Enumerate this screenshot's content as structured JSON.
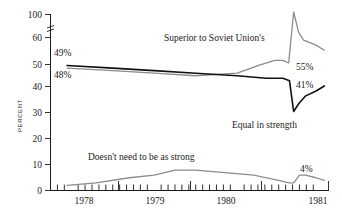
{
  "chart_data": {
    "type": "line",
    "title": "",
    "xlabel": "",
    "ylabel": "PERCENT",
    "ylim": [
      0,
      100
    ],
    "xlim": [
      1977.75,
      1981.1
    ],
    "grid": false,
    "legend_position": "inline-annotations",
    "axis_break": {
      "between": [
        60,
        100
      ],
      "style": "double-slash"
    },
    "ytick_labels": [
      "0",
      "10",
      "20",
      "30",
      "40",
      "50",
      "60",
      "100"
    ],
    "ytick_values": [
      0,
      10,
      20,
      30,
      40,
      50,
      60,
      100
    ],
    "xtick_labels": [
      "1978",
      "1979",
      "1980",
      "1981"
    ],
    "xtick_values": [
      1978,
      1979,
      1980,
      1981
    ],
    "minor_xticks_per_year": 12,
    "series": [
      {
        "name": "Superior to Soviet Union's",
        "color": "#8c8c8c",
        "start_label": "48%",
        "end_label": "55%",
        "x": [
          1977.95,
          1978.5,
          1979.0,
          1979.5,
          1980.0,
          1980.25,
          1980.45,
          1980.55,
          1980.62,
          1980.68,
          1980.74,
          1980.8,
          1980.95,
          1981.05
        ],
        "values": [
          48,
          47,
          46,
          45,
          46,
          49,
          51,
          51,
          50,
          70,
          62,
          59,
          57,
          55
        ]
      },
      {
        "name": "Equal in strength",
        "color": "#111111",
        "start_label": "49%",
        "end_label": "41%",
        "x": [
          1977.95,
          1978.5,
          1979.0,
          1979.5,
          1980.0,
          1980.35,
          1980.55,
          1980.63,
          1980.68,
          1980.74,
          1980.82,
          1980.95,
          1981.05
        ],
        "values": [
          49,
          48,
          47,
          46,
          45,
          44,
          44,
          43,
          31,
          34,
          37,
          39,
          41
        ]
      },
      {
        "name": "Doesn't need to be as strong",
        "color": "#8c8c8c",
        "start_label": "",
        "end_label": "4%",
        "x": [
          1977.95,
          1978.3,
          1978.7,
          1979.0,
          1979.25,
          1979.5,
          1979.85,
          1980.2,
          1980.5,
          1980.62,
          1980.68,
          1980.75,
          1980.82,
          1980.95,
          1981.05
        ],
        "values": [
          2,
          3,
          5,
          6,
          8,
          8,
          7,
          6,
          4,
          3,
          3,
          6,
          6,
          5,
          4
        ]
      }
    ],
    "annotations": [
      {
        "text": "Superior to Soviet Union's",
        "x": 164,
        "y": 41
      },
      {
        "text": "Equal in strength",
        "x": 232,
        "y": 128
      },
      {
        "text": "Doesn't need to be as strong",
        "x": 88,
        "y": 160
      },
      {
        "text": "49%",
        "x": 32,
        "y": 56
      },
      {
        "text": "48%",
        "x": 32,
        "y": 75
      },
      {
        "text": "55%",
        "x": 298,
        "y": 69
      },
      {
        "text": "41%",
        "x": 298,
        "y": 87
      },
      {
        "text": "4%",
        "x": 302,
        "y": 170
      }
    ]
  }
}
